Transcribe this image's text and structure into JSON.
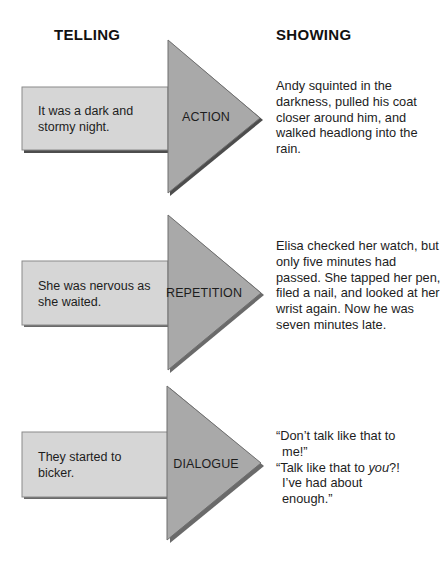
{
  "headings": {
    "telling": "TELLING",
    "showing": "SHOWING"
  },
  "colors": {
    "rect_fill": "#d6d6d6",
    "arrowhead_fill": "#a9a9a9",
    "shadow": "#4d4d4d",
    "outline": "#7a7a7a"
  },
  "rows": [
    {
      "telling": "It was a dark and stormy night.",
      "technique": "ACTION",
      "showing": "Andy squinted in the darkness, pulled his coat closer around him, and walked headlong into the rain."
    },
    {
      "telling": "She was nervous as she waited.",
      "technique": "REPETITION",
      "showing": "Elisa checked her watch, but only five minutes had passed. She tapped her pen, filed a nail, and looked at her wrist again. Now he was seven minutes late."
    },
    {
      "telling": "They started to bicker.",
      "technique": "DIALOGUE",
      "showing_lines": [
        {
          "before": "“Don’t talk like that to me!”",
          "italic": "",
          "after": ""
        },
        {
          "before": "“Talk like that to ",
          "italic": "you",
          "after": "?! I’ve had about enough.”"
        }
      ]
    }
  ]
}
